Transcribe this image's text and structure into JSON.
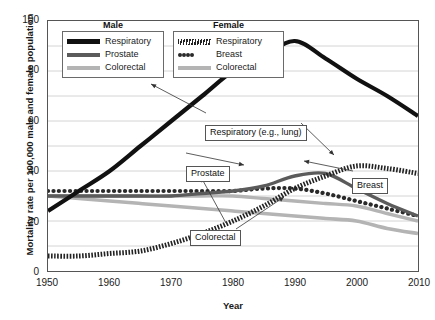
{
  "chart_data": {
    "type": "line",
    "title": "",
    "xlabel": "Year",
    "ylabel": "Mortality rate per 100,000 male and female population",
    "xlim": [
      1950,
      2010
    ],
    "ylim": [
      0,
      100
    ],
    "xticks": [
      1950,
      1960,
      1970,
      1980,
      1990,
      2000,
      2010
    ],
    "yticks": [
      0,
      20,
      40,
      60,
      80,
      100
    ],
    "grid": "horizontal-every-10",
    "legend_position": "top-inside",
    "x": [
      1950,
      1955,
      1960,
      1965,
      1970,
      1975,
      1980,
      1985,
      1990,
      1995,
      2000,
      2005,
      2010
    ],
    "series": [
      {
        "name": "Male Respiratory",
        "group": "Male",
        "label": "Respiratory",
        "style": "thick-solid-black",
        "color": "#111111",
        "values": [
          24,
          32,
          40,
          50,
          60,
          70,
          80,
          86,
          92,
          85,
          77,
          70,
          62
        ]
      },
      {
        "name": "Male Prostate",
        "group": "Male",
        "label": "Prostate",
        "style": "medium-solid-dark-gray",
        "color": "#5b5b5b",
        "values": [
          30,
          30,
          30,
          30,
          30,
          31,
          32,
          34,
          38,
          39,
          33,
          27,
          22
        ]
      },
      {
        "name": "Male Colorectal",
        "group": "Male",
        "label": "Colorectal",
        "style": "medium-solid-light-gray",
        "color": "#b4b4b4",
        "values": [
          30,
          30,
          30,
          30,
          30,
          30,
          30,
          29,
          28,
          27,
          26,
          23,
          20
        ]
      },
      {
        "name": "Female Respiratory",
        "group": "Female",
        "label": "Respiratory",
        "style": "hatched-dashed",
        "color": "#222222",
        "values": [
          6,
          6,
          7,
          8,
          11,
          15,
          20,
          26,
          33,
          38,
          42,
          41,
          39
        ]
      },
      {
        "name": "Female Breast",
        "group": "Female",
        "label": "Breast",
        "style": "round-dotted",
        "color": "#2a2a2a",
        "values": [
          32,
          32,
          32,
          32,
          32,
          32,
          32,
          33,
          33,
          31,
          28,
          25,
          22
        ]
      },
      {
        "name": "Female Colorectal",
        "group": "Female",
        "label": "Colorectal",
        "style": "thick-solid-light-gray",
        "color": "#b4b4b4",
        "values": [
          30,
          29,
          28,
          27,
          26,
          25,
          24,
          23,
          22,
          21,
          20,
          17,
          15
        ]
      }
    ],
    "annotations": [
      {
        "text": "Respiratory (e.g., lung)",
        "points_to": [
          "Male Respiratory",
          "Female Respiratory"
        ]
      },
      {
        "text": "Prostate",
        "points_to": [
          "Male Prostate"
        ]
      },
      {
        "text": "Colorectal",
        "points_to": [
          "Male Colorectal",
          "Female Colorectal"
        ]
      },
      {
        "text": "Breast",
        "points_to": [
          "Female Breast"
        ]
      }
    ]
  },
  "legend": {
    "male": {
      "title": "Male",
      "items": [
        {
          "label": "Respiratory",
          "swatch": "solid-black-line-icon"
        },
        {
          "label": "Prostate",
          "swatch": "solid-dark-gray-line-icon"
        },
        {
          "label": "Colorectal",
          "swatch": "solid-light-gray-line-icon"
        }
      ]
    },
    "female": {
      "title": "Female",
      "items": [
        {
          "label": "Respiratory",
          "swatch": "hatched-line-icon"
        },
        {
          "label": "Breast",
          "swatch": "dotted-line-icon"
        },
        {
          "label": "Colorectal",
          "swatch": "solid-light-gray-line-icon"
        }
      ]
    }
  },
  "axes": {
    "y_title": "Mortality rate per 100,000 male and female population",
    "x_title": "Year",
    "y_tick_labels": [
      "100",
      "80",
      "60",
      "40",
      "20",
      "0"
    ],
    "x_tick_labels": [
      "1950",
      "1960",
      "1970",
      "1980",
      "1990",
      "2000",
      "2010"
    ]
  },
  "callouts": {
    "respiratory": "Respiratory (e.g., lung)",
    "prostate": "Prostate",
    "colorectal": "Colorectal",
    "breast": "Breast"
  }
}
